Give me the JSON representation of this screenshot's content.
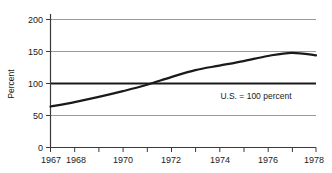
{
  "chart_data": {
    "type": "line",
    "title": "",
    "subtitle": "",
    "xlabel": "",
    "ylabel": "Percent",
    "xlim": [
      1967,
      1978
    ],
    "ylim": [
      0,
      200
    ],
    "grid": true,
    "grid_axis": "y",
    "legend": false,
    "legend_position": "none",
    "y_ticks": [
      0,
      50,
      100,
      150,
      200
    ],
    "y_tick_labels": [
      "0",
      "50",
      "100",
      "150",
      "200"
    ],
    "x_ticks": [
      1967,
      1968,
      1969,
      1970,
      1971,
      1972,
      1973,
      1974,
      1975,
      1976,
      1977,
      1978
    ],
    "x_tick_labels": [
      "1967",
      "1968",
      "",
      "1970",
      "",
      "1972",
      "",
      "1974",
      "",
      "1976",
      "",
      "1978"
    ],
    "annotations": [
      {
        "text": "U.S. = 100 percent",
        "x": 1975.2,
        "y": 85
      }
    ],
    "reference_lines": [
      {
        "y": 100,
        "label": "U.S. = 100 percent",
        "color": "#1a1a1a",
        "width": 2.0
      }
    ],
    "series": [
      {
        "name": "Index",
        "color": "#1a1a1a",
        "width": 2.2,
        "x": [
          1967,
          1968,
          1969,
          1970,
          1971,
          1972,
          1973,
          1974,
          1975,
          1976,
          1977,
          1978
        ],
        "values": [
          64,
          71,
          79,
          88,
          98,
          110,
          121,
          128,
          135,
          143,
          148,
          144
        ]
      }
    ]
  },
  "axis": {
    "y_label": "Percent",
    "y_tick_0": "0",
    "y_tick_50": "50",
    "y_tick_100": "100",
    "y_tick_150": "150",
    "y_tick_200": "200",
    "x_tick_1967": "1967",
    "x_tick_1968": "1968",
    "x_tick_1970": "1970",
    "x_tick_1972": "1972",
    "x_tick_1974": "1974",
    "x_tick_1976": "1976",
    "x_tick_1978": "1978"
  },
  "annotation": {
    "reference_note": "U.S. = 100 percent"
  },
  "colors": {
    "line": "#1a1a1a",
    "grid": "#9a9a9a",
    "axis": "#3a3a3a",
    "background": "#ffffff"
  }
}
